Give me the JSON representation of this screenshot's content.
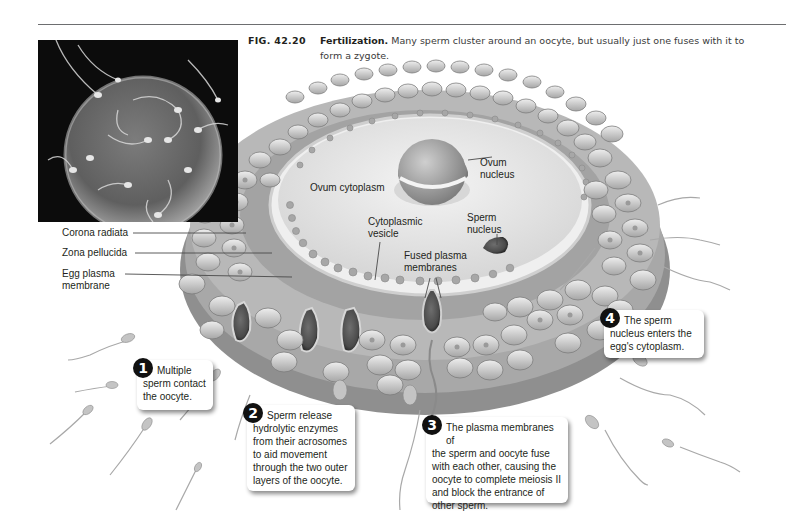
{
  "figure": {
    "number": "FIG. 42.20",
    "title": "Fertilization.",
    "caption_line1": "Many sperm cluster around an oocyte, but usually just one fuses with it to",
    "caption_line2": "form a zygote."
  },
  "photo": {
    "description": "Scanning electron micrograph of sperm clustered around an oocyte"
  },
  "labels": {
    "corona_radiata": "Corona radiata",
    "zona_pellucida": "Zona pellucida",
    "egg_plasma_membrane_1": "Egg plasma",
    "egg_plasma_membrane_2": "membrane",
    "ovum_cytoplasm": "Ovum cytoplasm",
    "ovum_nucleus_1": "Ovum",
    "ovum_nucleus_2": "nucleus",
    "cytoplasmic_vesicle_1": "Cytoplasmic",
    "cytoplasmic_vesicle_2": "vesicle",
    "sperm_nucleus_1": "Sperm",
    "sperm_nucleus_2": "nucleus",
    "fused_membranes_1": "Fused plasma",
    "fused_membranes_2": "membranes"
  },
  "steps": [
    {
      "number": "1",
      "lines": [
        "Multiple",
        "sperm contact",
        "the oocyte."
      ]
    },
    {
      "number": "2",
      "lines": [
        "Sperm release",
        "hydrolytic enzymes",
        "from their acrosomes",
        "to aid movement",
        "through the two outer",
        "layers of the oocyte."
      ]
    },
    {
      "number": "3",
      "lines": [
        "The plasma membranes of",
        "the sperm and oocyte fuse",
        "with each other, causing the",
        "oocyte to complete meiosis II",
        "and block the entrance of",
        "other sperm."
      ]
    },
    {
      "number": "4",
      "lines": [
        "The sperm",
        "nucleus enters the",
        "egg's cytoplasm."
      ]
    }
  ],
  "colors": {
    "background": "#ffffff",
    "text": "#231f20",
    "rule": "#6d6e70",
    "photo_bg": "#0c0c0c",
    "corona_cell": "#c9c9c9",
    "zona": "#a9a9a9",
    "cytoplasm": "#e4e4e4",
    "badge": "#111111"
  }
}
